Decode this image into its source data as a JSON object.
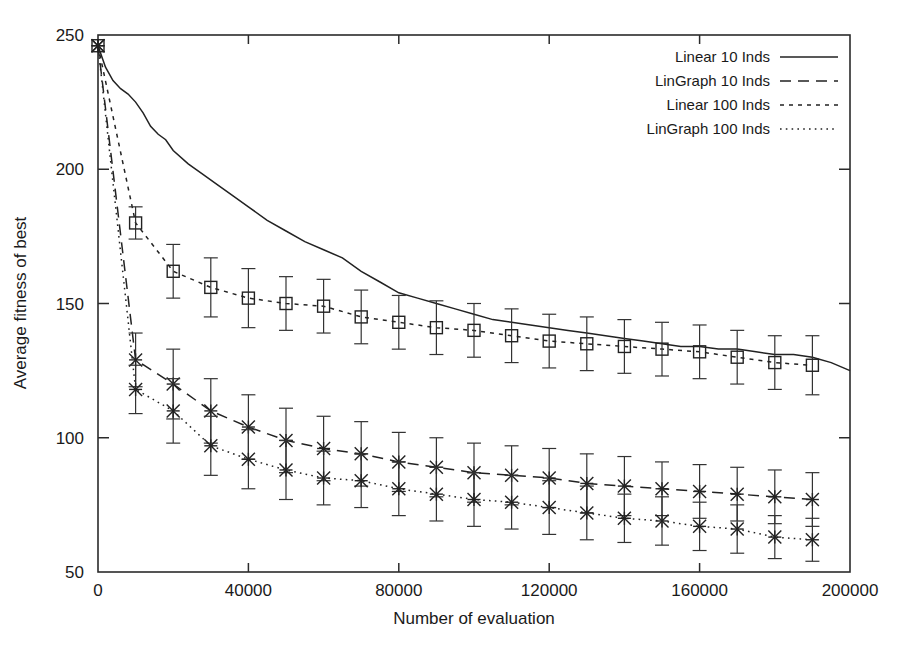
{
  "chart_data": {
    "type": "line",
    "title": "",
    "xlabel": "Number of evaluation",
    "ylabel": "Average fitness of best",
    "xlim": [
      0,
      200000
    ],
    "ylim": [
      50,
      250
    ],
    "xticks": [
      0,
      40000,
      80000,
      120000,
      160000,
      200000
    ],
    "xtick_labels": [
      "0",
      "40000",
      "80000",
      "120000",
      "160000",
      "200000"
    ],
    "yticks": [
      50,
      100,
      150,
      200,
      250
    ],
    "ytick_labels": [
      "50",
      "100",
      "150",
      "200",
      "250"
    ],
    "grid": false,
    "legend_position": "top-right",
    "series": [
      {
        "name": "Linear 10 Inds",
        "style": "solid",
        "marker": "none",
        "errorbars": false,
        "x": [
          0,
          2000,
          4000,
          6000,
          8000,
          10000,
          12000,
          14000,
          16000,
          18000,
          20000,
          24000,
          28000,
          32000,
          36000,
          40000,
          45000,
          50000,
          55000,
          60000,
          65000,
          70000,
          75000,
          80000,
          85000,
          90000,
          95000,
          100000,
          105000,
          110000,
          115000,
          120000,
          125000,
          130000,
          135000,
          140000,
          145000,
          150000,
          155000,
          160000,
          165000,
          170000,
          175000,
          180000,
          185000,
          190000,
          195000,
          200000
        ],
        "y": [
          246,
          238,
          233,
          230,
          228,
          225,
          221,
          216,
          213,
          211,
          207,
          202,
          198,
          194,
          190,
          186,
          181,
          177,
          173,
          170,
          167,
          162,
          158,
          154,
          152,
          150,
          148,
          146,
          144,
          143,
          142,
          141,
          140,
          139,
          138,
          137,
          136,
          135,
          134,
          134,
          133,
          133,
          132,
          131,
          131,
          130,
          128,
          125
        ]
      },
      {
        "name": "LinGraph 10 Inds",
        "style": "dashed",
        "marker": "cross",
        "errorbars": true,
        "x": [
          0,
          10000,
          20000,
          30000,
          40000,
          50000,
          60000,
          70000,
          80000,
          90000,
          100000,
          110000,
          120000,
          130000,
          140000,
          150000,
          160000,
          170000,
          180000,
          190000
        ],
        "y": [
          246,
          129,
          120,
          110,
          104,
          99,
          96,
          94,
          91,
          89,
          87,
          86,
          85,
          83,
          82,
          81,
          80,
          79,
          78,
          77
        ],
        "yerr": [
          3,
          10,
          13,
          12,
          12,
          12,
          12,
          12,
          11,
          11,
          11,
          11,
          11,
          11,
          11,
          10,
          10,
          10,
          10,
          10
        ]
      },
      {
        "name": "Linear 100 Inds",
        "style": "dotted",
        "marker": "square",
        "errorbars": true,
        "x": [
          0,
          10000,
          20000,
          30000,
          40000,
          50000,
          60000,
          70000,
          80000,
          90000,
          100000,
          110000,
          120000,
          130000,
          140000,
          150000,
          160000,
          170000,
          180000,
          190000
        ],
        "y": [
          246,
          180,
          162,
          156,
          152,
          150,
          149,
          145,
          143,
          141,
          140,
          138,
          136,
          135,
          134,
          133,
          132,
          130,
          128,
          127
        ],
        "yerr": [
          3,
          6,
          10,
          11,
          11,
          10,
          10,
          10,
          10,
          10,
          10,
          10,
          10,
          10,
          10,
          10,
          10,
          10,
          10,
          11
        ]
      },
      {
        "name": "LinGraph 100 Inds",
        "style": "fine-dotted",
        "marker": "cross",
        "errorbars": true,
        "x": [
          0,
          10000,
          20000,
          30000,
          40000,
          50000,
          60000,
          70000,
          80000,
          90000,
          100000,
          110000,
          120000,
          130000,
          140000,
          150000,
          160000,
          170000,
          180000,
          190000
        ],
        "y": [
          246,
          118,
          110,
          97,
          92,
          88,
          85,
          84,
          81,
          79,
          77,
          76,
          74,
          72,
          70,
          69,
          67,
          66,
          63,
          62
        ],
        "yerr": [
          3,
          9,
          12,
          11,
          11,
          11,
          10,
          10,
          10,
          10,
          10,
          10,
          10,
          10,
          9,
          9,
          9,
          9,
          8,
          8
        ]
      }
    ]
  },
  "legend": {
    "entries": [
      {
        "label": "Linear 10 Inds"
      },
      {
        "label": "LinGraph 10 Inds"
      },
      {
        "label": "Linear 100 Inds"
      },
      {
        "label": "LinGraph 100 Inds"
      }
    ]
  },
  "colors": {
    "ink": "#222222",
    "background": "#ffffff"
  }
}
